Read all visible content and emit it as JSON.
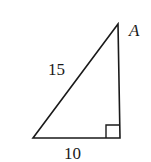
{
  "diagram": {
    "type": "right-triangle",
    "vertex_label": "A",
    "hypotenuse_label": "15",
    "base_label": "10",
    "right_angle_marker": true,
    "stroke_color": "#1a1a1a"
  }
}
